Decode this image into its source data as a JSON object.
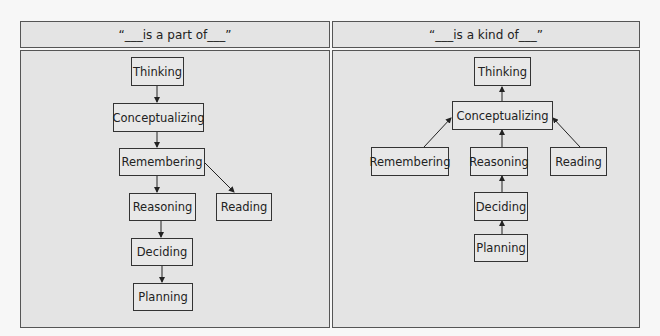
{
  "panels": {
    "left": {
      "title": "“___is a part of___”",
      "nodes": {
        "thinking": "Thinking",
        "conceptualizing": "Conceptualizing",
        "remembering": "Remembering",
        "reasoning": "Reasoning",
        "reading": "Reading",
        "deciding": "Deciding",
        "planning": "Planning"
      },
      "edges": [
        {
          "from": "Thinking",
          "to": "Conceptualizing"
        },
        {
          "from": "Conceptualizing",
          "to": "Remembering"
        },
        {
          "from": "Remembering",
          "to": "Reasoning"
        },
        {
          "from": "Remembering",
          "to": "Reading"
        },
        {
          "from": "Reasoning",
          "to": "Deciding"
        },
        {
          "from": "Deciding",
          "to": "Planning"
        }
      ]
    },
    "right": {
      "title": "“___is a kind of___”",
      "nodes": {
        "thinking": "Thinking",
        "conceptualizing": "Conceptualizing",
        "remembering": "Remembering",
        "reasoning": "Reasoning",
        "reading": "Reading",
        "deciding": "Deciding",
        "planning": "Planning"
      },
      "edges": [
        {
          "from": "Conceptualizing",
          "to": "Thinking"
        },
        {
          "from": "Remembering",
          "to": "Conceptualizing"
        },
        {
          "from": "Reasoning",
          "to": "Conceptualizing"
        },
        {
          "from": "Reading",
          "to": "Conceptualizing"
        },
        {
          "from": "Deciding",
          "to": "Reasoning"
        },
        {
          "from": "Planning",
          "to": "Deciding"
        }
      ]
    }
  },
  "colors": {
    "panel_fill": "#e4e4e4",
    "border": "#555555",
    "node_border": "#333333",
    "arrow": "#222222"
  }
}
